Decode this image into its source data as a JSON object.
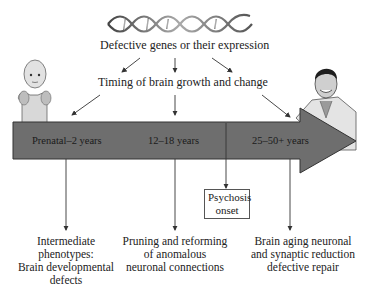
{
  "dna": {
    "label": "Defective genes or their expression"
  },
  "timing": {
    "label": "Timing of brain growth and change"
  },
  "timeline": {
    "color": "#6e6e6e",
    "stages": [
      {
        "label": "Prenatal–2 years"
      },
      {
        "label": "12–18 years"
      },
      {
        "label": "25–50+ years"
      }
    ]
  },
  "onset": {
    "line1": "Psychosis",
    "line2": "onset"
  },
  "outcomes": [
    {
      "lines": [
        "Intermediate",
        "phenotypes:",
        "Brain developmental",
        "defects"
      ]
    },
    {
      "lines": [
        "Pruning and reforming",
        "of anomalous",
        "neuronal connections"
      ]
    },
    {
      "lines": [
        "Brain aging neuronal",
        "and synaptic reduction",
        "defective repair"
      ]
    }
  ],
  "figures": {
    "left": "infant",
    "right": "adult-man"
  }
}
